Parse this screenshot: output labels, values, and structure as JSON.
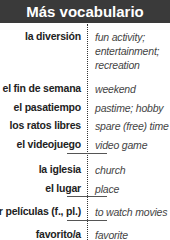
{
  "header": {
    "title": "Más vocabulario"
  },
  "entries": [
    {
      "es": "la diversión",
      "en": "fun activity; entertainment; recreation"
    },
    {
      "es": "el fin de semana",
      "en": "weekend"
    },
    {
      "es": "el pasatiempo",
      "en": "pastime; hobby"
    },
    {
      "es": "los ratos libres",
      "en": "spare (free) time"
    },
    {
      "es": "el videojuego",
      "en": "video game"
    },
    {
      "es": "la iglesia",
      "en": "church"
    },
    {
      "es": "el lugar",
      "en": "place"
    },
    {
      "es": "ver películas (f., pl.)",
      "en": "to watch movies"
    },
    {
      "es": "favorito/a",
      "en": "favorite"
    }
  ]
}
